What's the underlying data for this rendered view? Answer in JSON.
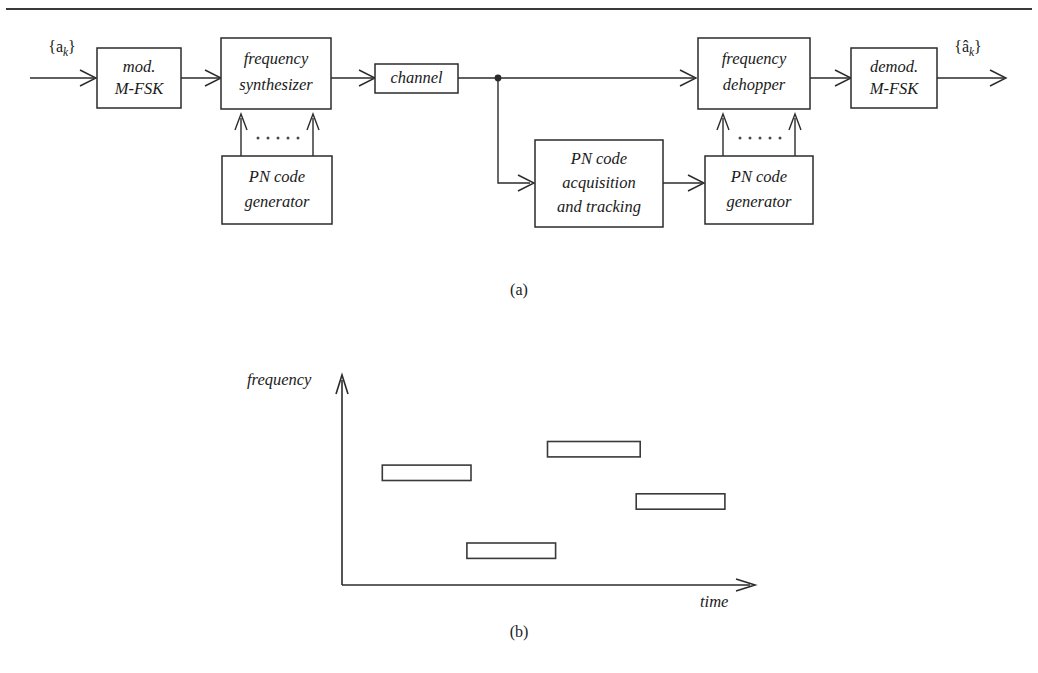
{
  "figure": {
    "top_rule": true,
    "panels": [
      {
        "id": "a",
        "caption": "(a)"
      },
      {
        "id": "b",
        "caption": "(b)"
      }
    ]
  },
  "block_diagram": {
    "input_signal_label": "{a",
    "input_signal_sub": "k",
    "input_signal_close": "}",
    "output_signal_label": "{â",
    "output_signal_sub": "k",
    "output_signal_close": "}",
    "blocks": [
      {
        "name": "modulator",
        "line1": "mod.",
        "line2": "M-FSK"
      },
      {
        "name": "frequency-synthesizer",
        "line1": "frequency",
        "line2": "synthesizer"
      },
      {
        "name": "pn-code-generator-tx",
        "line1": "PN code",
        "line2": "generator"
      },
      {
        "name": "channel",
        "line1": "channel",
        "line2": ""
      },
      {
        "name": "pn-code-acquisition",
        "line1": "PN code",
        "line2": "acquisition",
        "line3": "and tracking"
      },
      {
        "name": "pn-code-generator-rx",
        "line1": "PN code",
        "line2": "generator"
      },
      {
        "name": "frequency-dehopper",
        "line1": "frequency",
        "line2": "dehopper"
      },
      {
        "name": "demodulator",
        "line1": "demod.",
        "line2": "M-FSK"
      }
    ],
    "ellipsis_dots": 6
  },
  "chart_data": {
    "type": "bar",
    "title": "",
    "xlabel": "time",
    "ylabel": "frequency",
    "grid": false,
    "legend": null,
    "xlim": [
      0,
      10
    ],
    "ylim": [
      0,
      10
    ],
    "hops": [
      {
        "index": 1,
        "t_start": 1.0,
        "t_end": 3.2,
        "freq_low": 5.1,
        "freq_high": 5.85
      },
      {
        "index": 2,
        "t_start": 3.1,
        "t_end": 5.3,
        "freq_low": 1.3,
        "freq_high": 2.05
      },
      {
        "index": 3,
        "t_start": 5.1,
        "t_end": 7.4,
        "freq_low": 6.25,
        "freq_high": 7.0
      },
      {
        "index": 4,
        "t_start": 7.3,
        "t_end": 9.5,
        "freq_low": 3.7,
        "freq_high": 4.45
      }
    ],
    "categories": [
      "hop 1",
      "hop 2",
      "hop 3",
      "hop 4"
    ],
    "values": [
      5.85,
      2.05,
      7.0,
      4.45
    ]
  },
  "colors": {
    "ink": "#1a1a1a",
    "line": "#2b2b2b",
    "rule": "#3a3a3a",
    "paper": "#ffffff"
  }
}
